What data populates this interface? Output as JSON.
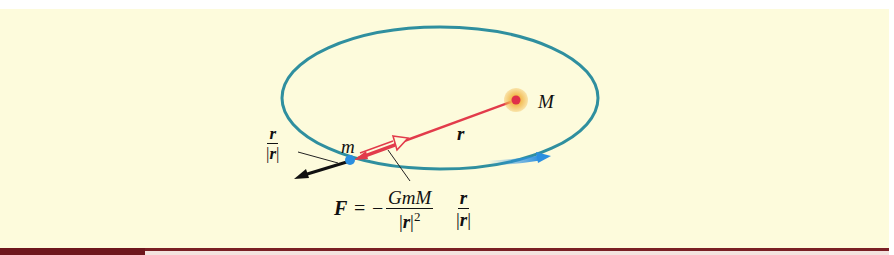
{
  "figure": {
    "labels": {
      "central_mass": "M",
      "orbiting_mass": "m",
      "position_vector": "r"
    },
    "unit_vector_label": {
      "numerator": "r",
      "denominator_bar": "|",
      "denominator": "r"
    },
    "formula": {
      "lhs": "F",
      "equals": "=",
      "minus": "−",
      "numerator": "GmM",
      "denominator": "r",
      "exponent": "2",
      "unit_numerator": "r",
      "unit_denominator": "r"
    },
    "colors": {
      "background": "#fdfbdc",
      "orbit": "#2f8f9f",
      "position_vector": "#e23b4b",
      "central_glow": "#f2b84b",
      "central_core": "#e0304a",
      "orbiting_body": "#2b8fe0",
      "velocity_arrow": "#2b8fe0",
      "force_arrow": "#111111",
      "bottom_bar": "#7a1f24"
    }
  }
}
